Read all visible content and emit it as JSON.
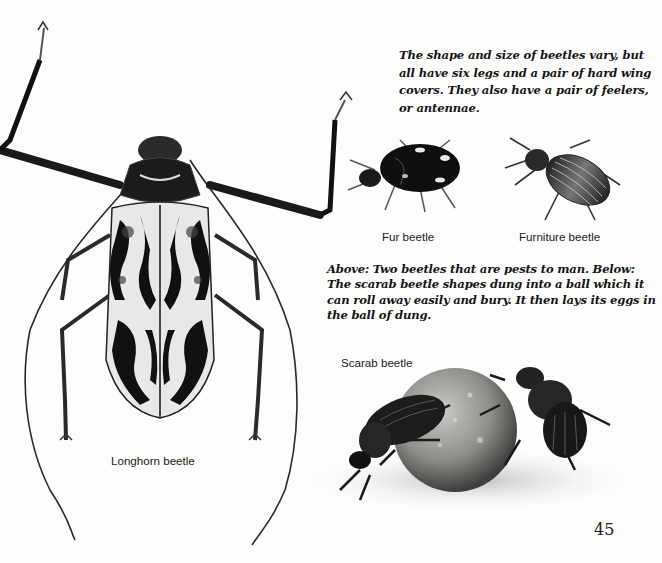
{
  "page": {
    "number": "45",
    "paragraphs": {
      "intro": "The shape and size of beetles vary, but all have six legs and a pair of hard wing covers. They also have a pair of feelers, or antennae.",
      "pests": "Above: Two beetles that are pests to man. Below: The scarab beetle shapes dung into a ball which it can roll away easily and bury. It then lays its eggs in the ball of dung."
    },
    "captions": {
      "fur": "Fur beetle",
      "furniture": "Furniture beetle",
      "longhorn": "Longhorn beetle",
      "scarab": "Scarab beetle"
    },
    "illustrations": [
      {
        "name": "longhorn-beetle",
        "label": "Longhorn beetle"
      },
      {
        "name": "fur-beetle",
        "label": "Fur beetle"
      },
      {
        "name": "furniture-beetle",
        "label": "Furniture beetle"
      },
      {
        "name": "scarab-beetle",
        "label": "Scarab beetle"
      }
    ]
  }
}
